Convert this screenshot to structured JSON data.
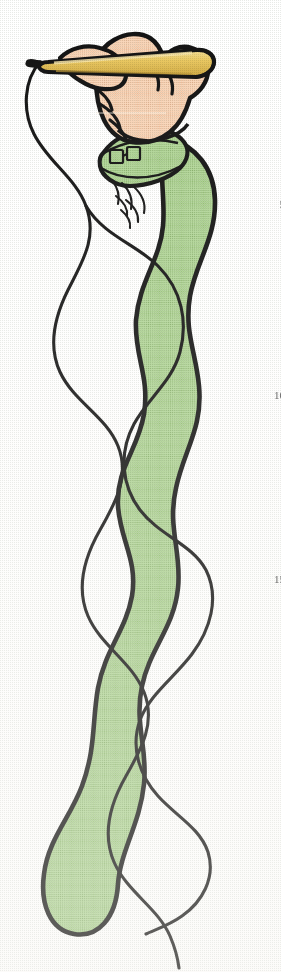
{
  "page": {
    "background_color": "#fdfdfc",
    "width": 281,
    "height": 972
  },
  "margin_numbers": [
    {
      "label": "5",
      "top": 198
    },
    {
      "label": "10",
      "top": 389
    },
    {
      "label": "15",
      "top": 573
    }
  ],
  "illustration": {
    "name": "hand-with-pencil-drawing-snake",
    "description": "A hand in a green sleeve holds a yellow pencil and draws one long continuous wavy line; a thick green serpentine shape runs down the page.",
    "colors": {
      "outline": "#111111",
      "skin": "#f3c7a5",
      "skin_shadow": "#e0a87f",
      "pencil_body": "#e8c45c",
      "pencil_highlight": "#f4dd98",
      "pencil_shadow": "#c9a23c",
      "sleeve_green": "#a7cd8b",
      "sleeve_green_dark": "#8fba73",
      "sleeve_green_light": "#bcdaa4",
      "drawn_line": "#141414",
      "paper": "#ffffff"
    },
    "parts": [
      {
        "name": "pencil",
        "label": "Pencil"
      },
      {
        "name": "hand",
        "label": "Hand"
      },
      {
        "name": "cuff",
        "label": "Shirt cuff with buttons"
      },
      {
        "name": "sleeve",
        "label": "Green sleeve / serpentine body"
      },
      {
        "name": "drawn-line",
        "label": "Continuous drawn line"
      }
    ]
  }
}
